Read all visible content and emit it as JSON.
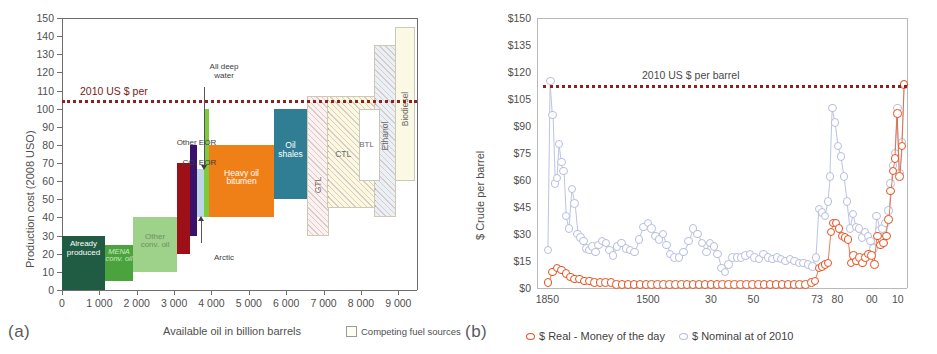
{
  "panel_a": {
    "letter": "(a)",
    "ylabel": "Production cost (2008 USO)",
    "xlabel": "Available oil in billion barrels",
    "yticks": [
      "0",
      "10",
      "20",
      "30",
      "40",
      "50",
      "60",
      "70",
      "80",
      "90",
      "100",
      "110",
      "120",
      "130",
      "140",
      "150"
    ],
    "xticks": [
      "0",
      "1 000",
      "2 000",
      "3 000",
      "4 000",
      "5 000",
      "6 000",
      "7 000",
      "8 000",
      "9 000"
    ],
    "refline_label": "2010 US $ per",
    "legend_label": "Competing fuel sources",
    "annotations": {
      "all_deep_water": "All deep\nwater",
      "other_eor": "Other EOR",
      "co2_eor": "CO. EOR",
      "arctic": "Arctic"
    },
    "chart_data": {
      "type": "bar",
      "title": "",
      "xlabel": "Available oil in billion barrels",
      "ylabel": "Production cost (2008 USO)",
      "xlim": [
        0,
        9500
      ],
      "ylim": [
        0,
        150
      ],
      "grid": false,
      "reference_line": {
        "value": 105,
        "label": "2010 US $ per",
        "style": "dotted",
        "color": "#8f2020"
      },
      "note": "Supply cost curve: each bar spans an x-range (cumulative available oil, billion barrels) and a y-range (production cost, 2008 USD/bbl)",
      "bars": [
        {
          "label": "Already produced",
          "x_start": 0,
          "x_end": 1150,
          "cost_low": 0,
          "cost_high": 30,
          "color": "#1f5c43",
          "text_color": "#ffffff",
          "hatch": false
        },
        {
          "label": "MENA conv. oil",
          "x_start": 1150,
          "x_end": 1900,
          "cost_low": 5,
          "cost_high": 25,
          "color": "#4aa33d",
          "text_color": "#e8f4e4",
          "hatch": false
        },
        {
          "label": "Other conv. oil",
          "x_start": 1900,
          "x_end": 3080,
          "cost_low": 10,
          "cost_high": 40,
          "color": "#9ed18a",
          "text_color": "#5d7a52",
          "hatch": false
        },
        {
          "label": "CO. EOR",
          "x_start": 3080,
          "x_end": 3420,
          "cost_low": 20,
          "cost_high": 70,
          "color": "#9e1018",
          "text_color": "#ffffff",
          "hatch": false
        },
        {
          "label": "Other EOR",
          "x_start": 3420,
          "x_end": 3600,
          "cost_low": 30,
          "cost_high": 80,
          "color": "#3b1269",
          "text_color": "#ffffff",
          "hatch": false
        },
        {
          "label": "Arctic",
          "x_start": 3600,
          "x_end": 3790,
          "cost_low": 40,
          "cost_high": 67,
          "color": "#bcd6e8",
          "text_color": "#4f4f4f",
          "hatch": false
        },
        {
          "label": "All deep water",
          "x_start": 3790,
          "x_end": 3930,
          "cost_low": 40,
          "cost_high": 100,
          "color": "#7ec93c",
          "text_color": "#4f4f4f",
          "hatch": false
        },
        {
          "label": "Heavy oil bitumen",
          "x_start": 3930,
          "x_end": 5680,
          "cost_low": 40,
          "cost_high": 80,
          "color": "#ef7f17",
          "text_color": "#ffffff",
          "hatch": false
        },
        {
          "label": "Oil shales",
          "x_start": 5680,
          "x_end": 6550,
          "cost_low": 50,
          "cost_high": 100,
          "color": "#2f7e94",
          "text_color": "#ffffff",
          "hatch": false
        },
        {
          "label": "GTL",
          "x_start": 6550,
          "x_end": 7150,
          "cost_low": 30,
          "cost_high": 107,
          "color": "#fdf1f0",
          "text_color": "#6a6a6a",
          "hatch": true
        },
        {
          "label": "CTL",
          "x_start": 7100,
          "x_end": 8400,
          "cost_low": 45,
          "cost_high": 107,
          "color": "#fbf8dd",
          "text_color": "#6a6a6a",
          "hatch": true
        },
        {
          "label": "BTL",
          "x_start": 7950,
          "x_end": 8500,
          "cost_low": 60,
          "cost_high": 100,
          "color": "#ffffff",
          "text_color": "#6a6a6a",
          "hatch": false
        },
        {
          "label": "Ethanol",
          "x_start": 8350,
          "x_end": 8950,
          "cost_low": 40,
          "cost_high": 135,
          "color": "#e9f1f7",
          "text_color": "#6a6a6a",
          "hatch": true
        },
        {
          "label": "Biodiesel",
          "x_start": 8900,
          "x_end": 9450,
          "cost_low": 60,
          "cost_high": 145,
          "color": "#fbf8e4",
          "text_color": "#6a6a6a",
          "hatch": false
        }
      ]
    }
  },
  "panel_b": {
    "letter": "(b)",
    "ylabel": "$ Crude per barrel",
    "yticks": [
      "$0",
      "$15",
      "$30",
      "$45",
      "$60",
      "$75",
      "$90",
      "$105",
      "$120",
      "$135",
      "$150"
    ],
    "xticks": [
      {
        "label": "1850",
        "pos": 0.028
      },
      {
        "label": "1500",
        "pos": 0.3
      },
      {
        "label": "30",
        "pos": 0.47
      },
      {
        "label": "50",
        "pos": 0.585
      },
      {
        "label": "73",
        "pos": 0.757
      },
      {
        "label": "80",
        "pos": 0.812
      },
      {
        "label": "00",
        "pos": 0.905
      },
      {
        "label": "10",
        "pos": 0.975
      }
    ],
    "refline_label": "2010 US $ per barrel",
    "legend": [
      {
        "label": "$ Real - Money of the day",
        "color": "#e4511e"
      },
      {
        "label": "$ Nominal at of 2010",
        "color": "#b6bedd"
      }
    ],
    "chart_data": {
      "type": "scatter",
      "title": "",
      "xlabel": "",
      "ylabel": "$ Crude per barrel",
      "ylim": [
        0,
        150
      ],
      "grid": false,
      "legend_position": "bottom",
      "reference_line": {
        "value": 113,
        "label": "2010 US $ per barrel",
        "style": "dotted",
        "color": "#8f2020"
      },
      "series": [
        {
          "name": "$ Real - Money of the day",
          "color": "#e4511e",
          "note": "Nominal money-of-the-day price; flat near $0-$5 until 1973, rising steeply after 2000 to ~$113 in 2010",
          "points": [
            [
              0.03,
              3
            ],
            [
              0.042,
              9
            ],
            [
              0.054,
              11
            ],
            [
              0.066,
              10
            ],
            [
              0.078,
              8
            ],
            [
              0.09,
              6
            ],
            [
              0.102,
              5
            ],
            [
              0.115,
              5
            ],
            [
              0.128,
              4
            ],
            [
              0.142,
              4
            ],
            [
              0.156,
              3
            ],
            [
              0.17,
              3
            ],
            [
              0.185,
              3
            ],
            [
              0.2,
              3
            ],
            [
              0.215,
              2
            ],
            [
              0.23,
              2
            ],
            [
              0.246,
              2
            ],
            [
              0.262,
              2
            ],
            [
              0.278,
              2
            ],
            [
              0.294,
              2
            ],
            [
              0.31,
              2
            ],
            [
              0.326,
              2
            ],
            [
              0.342,
              2
            ],
            [
              0.358,
              2
            ],
            [
              0.374,
              2
            ],
            [
              0.39,
              2
            ],
            [
              0.406,
              2
            ],
            [
              0.422,
              2
            ],
            [
              0.438,
              2
            ],
            [
              0.454,
              2
            ],
            [
              0.47,
              2
            ],
            [
              0.486,
              2
            ],
            [
              0.502,
              2
            ],
            [
              0.518,
              2
            ],
            [
              0.534,
              2
            ],
            [
              0.55,
              2
            ],
            [
              0.566,
              2
            ],
            [
              0.582,
              2
            ],
            [
              0.598,
              2
            ],
            [
              0.614,
              2
            ],
            [
              0.63,
              2
            ],
            [
              0.646,
              2
            ],
            [
              0.662,
              2
            ],
            [
              0.678,
              2
            ],
            [
              0.694,
              2
            ],
            [
              0.71,
              2
            ],
            [
              0.726,
              2
            ],
            [
              0.742,
              3
            ],
            [
              0.752,
              4
            ],
            [
              0.762,
              11
            ],
            [
              0.77,
              12
            ],
            [
              0.778,
              13
            ],
            [
              0.786,
              14
            ],
            [
              0.794,
              31
            ],
            [
              0.8,
              36
            ],
            [
              0.808,
              36
            ],
            [
              0.816,
              33
            ],
            [
              0.824,
              29
            ],
            [
              0.832,
              28
            ],
            [
              0.84,
              27
            ],
            [
              0.848,
              14
            ],
            [
              0.856,
              18
            ],
            [
              0.864,
              15
            ],
            [
              0.872,
              17
            ],
            [
              0.88,
              14
            ],
            [
              0.888,
              17
            ],
            [
              0.896,
              19
            ],
            [
              0.904,
              18
            ],
            [
              0.912,
              13
            ],
            [
              0.92,
              29
            ],
            [
              0.928,
              24
            ],
            [
              0.936,
              25
            ],
            [
              0.944,
              29
            ],
            [
              0.95,
              38
            ],
            [
              0.956,
              54
            ],
            [
              0.962,
              65
            ],
            [
              0.968,
              72
            ],
            [
              0.974,
              97
            ],
            [
              0.98,
              62
            ],
            [
              0.986,
              79
            ],
            [
              0.992,
              113
            ]
          ]
        },
        {
          "name": "$ Nominal at of 2010",
          "color": "#b6bedd",
          "note": "Price deflated to 2010 dollars; spikes above $100 in early 1860s and near 1980",
          "points": [
            [
              0.03,
              21
            ],
            [
              0.036,
              115
            ],
            [
              0.042,
              96
            ],
            [
              0.048,
              58
            ],
            [
              0.054,
              61
            ],
            [
              0.06,
              80
            ],
            [
              0.066,
              70
            ],
            [
              0.072,
              65
            ],
            [
              0.078,
              40
            ],
            [
              0.086,
              33
            ],
            [
              0.094,
              55
            ],
            [
              0.102,
              47
            ],
            [
              0.11,
              30
            ],
            [
              0.118,
              28
            ],
            [
              0.126,
              26
            ],
            [
              0.134,
              22
            ],
            [
              0.142,
              21
            ],
            [
              0.15,
              23
            ],
            [
              0.158,
              20
            ],
            [
              0.166,
              24
            ],
            [
              0.176,
              26
            ],
            [
              0.186,
              25
            ],
            [
              0.196,
              21
            ],
            [
              0.206,
              18
            ],
            [
              0.216,
              23
            ],
            [
              0.228,
              25
            ],
            [
              0.24,
              22
            ],
            [
              0.252,
              21
            ],
            [
              0.264,
              20
            ],
            [
              0.276,
              27
            ],
            [
              0.288,
              34
            ],
            [
              0.3,
              36
            ],
            [
              0.31,
              33
            ],
            [
              0.32,
              29
            ],
            [
              0.33,
              27
            ],
            [
              0.34,
              30
            ],
            [
              0.35,
              24
            ],
            [
              0.36,
              19
            ],
            [
              0.372,
              17
            ],
            [
              0.384,
              17
            ],
            [
              0.396,
              20
            ],
            [
              0.41,
              26
            ],
            [
              0.422,
              33
            ],
            [
              0.434,
              30
            ],
            [
              0.446,
              25
            ],
            [
              0.458,
              20
            ],
            [
              0.468,
              25
            ],
            [
              0.478,
              23
            ],
            [
              0.488,
              19
            ],
            [
              0.498,
              11
            ],
            [
              0.508,
              9
            ],
            [
              0.518,
              13
            ],
            [
              0.528,
              17
            ],
            [
              0.54,
              17
            ],
            [
              0.552,
              17
            ],
            [
              0.564,
              18
            ],
            [
              0.576,
              19
            ],
            [
              0.588,
              17
            ],
            [
              0.6,
              16
            ],
            [
              0.612,
              19
            ],
            [
              0.624,
              17
            ],
            [
              0.636,
              16
            ],
            [
              0.648,
              17
            ],
            [
              0.66,
              16
            ],
            [
              0.672,
              15
            ],
            [
              0.684,
              16
            ],
            [
              0.696,
              15
            ],
            [
              0.708,
              14
            ],
            [
              0.72,
              14
            ],
            [
              0.732,
              13
            ],
            [
              0.744,
              12
            ],
            [
              0.754,
              17
            ],
            [
              0.762,
              44
            ],
            [
              0.77,
              42
            ],
            [
              0.778,
              40
            ],
            [
              0.786,
              48
            ],
            [
              0.792,
              62
            ],
            [
              0.798,
              100
            ],
            [
              0.806,
              92
            ],
            [
              0.814,
              79
            ],
            [
              0.822,
              73
            ],
            [
              0.83,
              62
            ],
            [
              0.838,
              48
            ],
            [
              0.846,
              33
            ],
            [
              0.854,
              41
            ],
            [
              0.862,
              34
            ],
            [
              0.87,
              33
            ],
            [
              0.878,
              28
            ],
            [
              0.886,
              31
            ],
            [
              0.894,
              29
            ],
            [
              0.902,
              26
            ],
            [
              0.91,
              22
            ],
            [
              0.918,
              40
            ],
            [
              0.926,
              32
            ],
            [
              0.934,
              33
            ],
            [
              0.942,
              36
            ],
            [
              0.95,
              43
            ],
            [
              0.956,
              58
            ],
            [
              0.962,
              68
            ],
            [
              0.968,
              75
            ],
            [
              0.974,
              100
            ],
            [
              0.98,
              64
            ],
            [
              0.986,
              81
            ],
            [
              0.992,
              113
            ]
          ]
        }
      ]
    }
  }
}
